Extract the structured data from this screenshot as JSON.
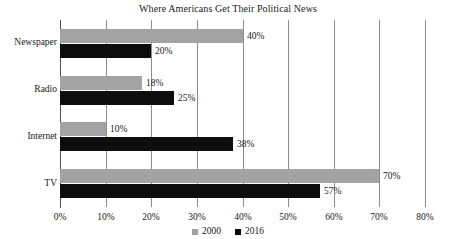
{
  "chart_data": {
    "type": "bar",
    "orientation": "horizontal",
    "title": "Where Americans Get Their Political News",
    "xlabel": "",
    "ylabel": "",
    "xlim": [
      0,
      80
    ],
    "xticks": [
      "0%",
      "10%",
      "20%",
      "30%",
      "40%",
      "50%",
      "60%",
      "70%",
      "80%"
    ],
    "xtick_values": [
      0,
      10,
      20,
      30,
      40,
      50,
      60,
      70,
      80
    ],
    "grid": true,
    "grid_axis": "x",
    "legend_position": "bottom-center",
    "categories": [
      "Newspaper",
      "Radio",
      "Internet",
      "TV"
    ],
    "series": [
      {
        "name": "2000",
        "color": "#a3a3a3",
        "values": [
          40,
          18,
          10,
          70
        ],
        "labels": [
          "40%",
          "18%",
          "10%",
          "70%"
        ]
      },
      {
        "name": "2016",
        "color": "#0d0d0d",
        "values": [
          20,
          25,
          38,
          57
        ],
        "labels": [
          "20%",
          "25%",
          "38%",
          "57%"
        ]
      }
    ]
  },
  "legend": {
    "items": [
      {
        "label": "2000",
        "color": "#a3a3a3"
      },
      {
        "label": "2016",
        "color": "#0d0d0d"
      }
    ]
  },
  "colors": {
    "series_2000": "#a3a3a3",
    "series_2016": "#0d0d0d",
    "gridline": "#8c8c8c",
    "axis": "#4d4d4d",
    "background": "#ffffff",
    "text": "#1a1a1a"
  }
}
